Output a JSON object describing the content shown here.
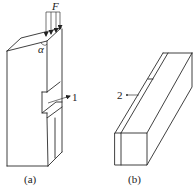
{
  "figure": {
    "panels": [
      {
        "id": "a",
        "caption": "(a)",
        "labels": {
          "force": "F",
          "angle": "α",
          "part_number": "1"
        },
        "description": "Specimen block with inclined top face loaded by force F at angle α, with a notch on the side marked 1"
      },
      {
        "id": "b",
        "caption": "(b)",
        "labels": {
          "part_number": "2"
        },
        "description": "Rectangular prism bar with a longitudinal strip marked 2"
      }
    ]
  }
}
